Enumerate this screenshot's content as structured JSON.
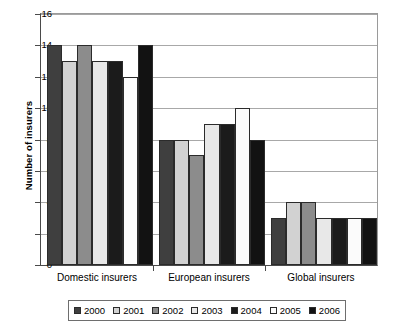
{
  "chart_data": {
    "type": "bar",
    "title": "",
    "subtitle": "",
    "xlabel": "",
    "ylabel": "Number of insurers",
    "categories": [
      "Domestic insurers",
      "European insurers",
      "Global insurers"
    ],
    "series": [
      {
        "name": "2000",
        "color": "#3f3f3f",
        "values": [
          14,
          8,
          3
        ]
      },
      {
        "name": "2001",
        "color": "#d2d2d2",
        "values": [
          13,
          8,
          4
        ]
      },
      {
        "name": "2002",
        "color": "#8c8c8c",
        "values": [
          14,
          7,
          4
        ]
      },
      {
        "name": "2003",
        "color": "#e8e8e8",
        "values": [
          13,
          9,
          3
        ]
      },
      {
        "name": "2004",
        "color": "#1b1b1b",
        "values": [
          13,
          9,
          3
        ]
      },
      {
        "name": "2005",
        "color": "#fbfbfb",
        "values": [
          12,
          10,
          3
        ]
      },
      {
        "name": "2006",
        "color": "#121212",
        "values": [
          14,
          8,
          3
        ]
      }
    ],
    "ylim": [
      0,
      16
    ],
    "ytick_labels": [
      "0",
      "2",
      "4",
      "6",
      "8",
      "10",
      "12",
      "14",
      "16"
    ],
    "ytick_values": [
      0,
      2,
      4,
      6,
      8,
      10,
      12,
      14,
      16
    ],
    "grid": "horizontal",
    "legend_position": "bottom",
    "legend_entries": [
      "2000",
      "2001",
      "2002",
      "2003",
      "2004",
      "2005",
      "2006"
    ]
  }
}
